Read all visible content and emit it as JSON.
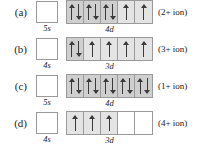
{
  "figure": {
    "rows": [
      {
        "row_label": "(a)",
        "s_label": "5s",
        "s_occupancy": "empty",
        "d_label": "4d",
        "ion_label": "(2+ ion)",
        "d_cells": [
          {
            "arrows": [
              "up",
              "down"
            ],
            "shade": "shade-dark"
          },
          {
            "arrows": [
              "up",
              "down"
            ],
            "shade": "shade-dark"
          },
          {
            "arrows": [
              "up",
              "down"
            ],
            "shade": "shade-dark"
          },
          {
            "arrows": [
              "up"
            ],
            "shade": "shade-light"
          },
          {
            "arrows": [
              "up"
            ],
            "shade": "shade-light"
          }
        ]
      },
      {
        "row_label": "(b)",
        "s_label": "4s",
        "s_occupancy": "empty",
        "d_label": "3d",
        "ion_label": "(3+ ion)",
        "d_cells": [
          {
            "arrows": [
              "up",
              "down"
            ],
            "shade": "shade-dark"
          },
          {
            "arrows": [
              "up"
            ],
            "shade": "shade-light"
          },
          {
            "arrows": [
              "up"
            ],
            "shade": "shade-light"
          },
          {
            "arrows": [
              "up"
            ],
            "shade": "shade-light"
          },
          {
            "arrows": [
              "up"
            ],
            "shade": "shade-light"
          }
        ]
      },
      {
        "row_label": "(c)",
        "s_label": "5s",
        "s_occupancy": "empty",
        "d_label": "4d",
        "ion_label": "(1+ ion)",
        "d_cells": [
          {
            "arrows": [
              "up",
              "down"
            ],
            "shade": "shade-dark"
          },
          {
            "arrows": [
              "up",
              "down"
            ],
            "shade": "shade-dark"
          },
          {
            "arrows": [
              "up",
              "down"
            ],
            "shade": "shade-dark"
          },
          {
            "arrows": [
              "up",
              "down"
            ],
            "shade": "shade-dark"
          },
          {
            "arrows": [
              "up",
              "down"
            ],
            "shade": "shade-dark"
          }
        ]
      },
      {
        "row_label": "(d)",
        "s_label": "4s",
        "s_occupancy": "empty",
        "d_label": "3d",
        "ion_label": "(4+ ion)",
        "d_cells": [
          {
            "arrows": [
              "up"
            ],
            "shade": "shade-light"
          },
          {
            "arrows": [
              "up"
            ],
            "shade": "shade-light"
          },
          {
            "arrows": [
              "up"
            ],
            "shade": "shade-light"
          },
          {
            "arrows": [],
            "shade": "shade-none"
          },
          {
            "arrows": [],
            "shade": "shade-none"
          }
        ]
      }
    ],
    "colors": {
      "box_border": "#9a9a9a",
      "arrow": "#3a3a3a",
      "shade_light": "#e4e4e4",
      "shade_dark": "#cfcfcf",
      "background": "#ffffff"
    }
  }
}
